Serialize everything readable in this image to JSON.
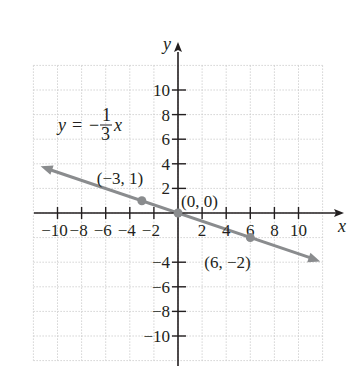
{
  "chart_data": {
    "type": "line",
    "title": "",
    "equation": "y = -1/3 x",
    "equation_parts": {
      "lhs": "y",
      "eq": "=",
      "minus": "−",
      "num": "1",
      "den": "3",
      "var": "x"
    },
    "xlabel": "x",
    "ylabel": "y",
    "xlim": [
      -12,
      12
    ],
    "ylim": [
      -12,
      12
    ],
    "grid": true,
    "grid_step": 2,
    "x_ticks": [
      -10,
      -8,
      -6,
      -4,
      -2,
      2,
      4,
      6,
      8,
      10
    ],
    "x_tick_labels": [
      "−10",
      "−8",
      "−6",
      "−4",
      "−2",
      "2",
      "4",
      "6",
      "8",
      "10"
    ],
    "y_ticks": [
      10,
      8,
      6,
      4,
      2,
      -4,
      -6,
      -8,
      -10
    ],
    "y_tick_labels": [
      "10",
      "8",
      "6",
      "4",
      "2",
      "−4",
      "−6",
      "−8",
      "−10"
    ],
    "series": [
      {
        "name": "y = -1/3 x",
        "slope": -0.3333,
        "intercept": 0,
        "x_range": [
          -12,
          12
        ],
        "arrows": "both",
        "color": "#8a8c8e"
      }
    ],
    "points": [
      {
        "x": -3,
        "y": 1,
        "label": "(−3, 1)"
      },
      {
        "x": 0,
        "y": 0,
        "label": "(0, 0)"
      },
      {
        "x": 6,
        "y": -2,
        "label": "(6, −2)"
      }
    ],
    "colors": {
      "axis": "#231f20",
      "line": "#8a8c8e",
      "grid": "#c8c8c8"
    }
  }
}
